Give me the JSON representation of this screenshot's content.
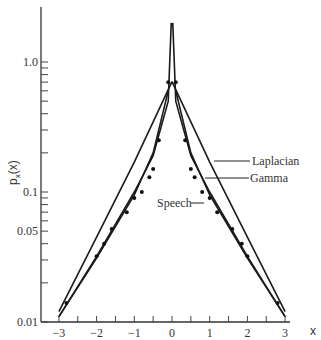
{
  "chart_data": {
    "type": "line",
    "title": "",
    "xlabel": "x",
    "ylabel": "p_x(x)",
    "xlim": [
      -3,
      3
    ],
    "ylim": [
      0.01,
      2.0
    ],
    "yscale": "log",
    "grid": false,
    "x_ticks": [
      "-3",
      "-2",
      "-1",
      "0",
      "1",
      "2",
      "3"
    ],
    "x_tick_values": [
      -3,
      -2,
      -1,
      0,
      1,
      2,
      3
    ],
    "y_tick_labels": [
      "0.01",
      "0.05",
      "0.1",
      "1.0"
    ],
    "y_tick_values": [
      0.01,
      0.05,
      0.1,
      1.0
    ],
    "legend_position": "inline-annotations-right",
    "series": [
      {
        "name": "Laplacian",
        "style": "line",
        "x": [
          -3,
          -2,
          -1,
          0,
          1,
          2,
          3
        ],
        "values": [
          0.012,
          0.045,
          0.17,
          0.707,
          0.17,
          0.045,
          0.012
        ]
      },
      {
        "name": "Gamma",
        "style": "line",
        "x": [
          -3,
          -2,
          -1,
          -0.5,
          -0.1,
          -0.02,
          0.02,
          0.1,
          0.5,
          1,
          2,
          3
        ],
        "values": [
          0.011,
          0.032,
          0.1,
          0.19,
          0.5,
          2.0,
          2.0,
          0.5,
          0.19,
          0.1,
          0.032,
          0.011
        ]
      },
      {
        "name": "Speech",
        "style": "line",
        "x": [
          -3,
          -2,
          -1,
          -0.5,
          -0.1,
          0.1,
          0.5,
          1,
          2,
          3
        ],
        "values": [
          0.011,
          0.031,
          0.095,
          0.2,
          0.6,
          0.6,
          0.2,
          0.095,
          0.031,
          0.011
        ]
      },
      {
        "name": "Speech (measured points)",
        "style": "scatter",
        "x": [
          -2.8,
          -2.0,
          -1.8,
          -1.6,
          -1.2,
          -1.0,
          -0.8,
          -0.6,
          -0.5,
          -0.35,
          -0.1,
          0.1,
          0.35,
          0.5,
          0.6,
          0.8,
          1.0,
          1.2,
          1.6,
          1.85,
          2.0,
          2.8
        ],
        "values": [
          0.014,
          0.032,
          0.04,
          0.052,
          0.07,
          0.09,
          0.1,
          0.13,
          0.15,
          0.25,
          0.7,
          0.7,
          0.25,
          0.15,
          0.13,
          0.1,
          0.09,
          0.07,
          0.052,
          0.04,
          0.032,
          0.014
        ]
      }
    ],
    "annotations": [
      {
        "text": "Laplacian",
        "points_to": "Laplacian"
      },
      {
        "text": "Gamma",
        "points_to": "Gamma"
      },
      {
        "text": "Speech",
        "points_to": "Speech"
      }
    ]
  },
  "labels": {
    "xlabel": "x",
    "ylabel_main": "p",
    "ylabel_sub": "x",
    "ylabel_arg": "(x)",
    "legend_laplacian": "Laplacian",
    "legend_gamma": "Gamma",
    "legend_speech": "Speech"
  }
}
